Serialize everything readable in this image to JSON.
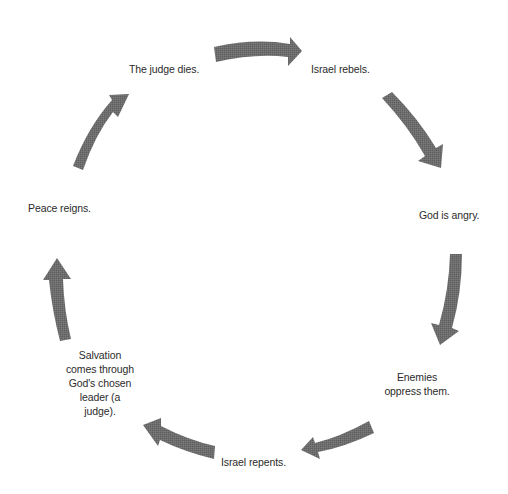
{
  "diagram": {
    "type": "cycle",
    "arrow_color": "#6b6b6b",
    "background": "#ffffff",
    "steps": [
      {
        "id": "judge-dies",
        "label": "The judge dies."
      },
      {
        "id": "israel-rebels",
        "label": "Israel rebels."
      },
      {
        "id": "god-angry",
        "label": "God is angry."
      },
      {
        "id": "enemies-oppress",
        "label_lines": [
          "Enemies",
          "oppress them."
        ]
      },
      {
        "id": "israel-repents",
        "label": "Israel repents."
      },
      {
        "id": "salvation",
        "label_lines": [
          "Salvation",
          "comes through",
          "God's chosen",
          "leader (a",
          "judge)."
        ]
      },
      {
        "id": "peace-reigns",
        "label": "Peace reigns."
      }
    ],
    "arrows": [
      {
        "from": "judge-dies",
        "to": "israel-rebels"
      },
      {
        "from": "israel-rebels",
        "to": "god-angry"
      },
      {
        "from": "god-angry",
        "to": "enemies-oppress"
      },
      {
        "from": "enemies-oppress",
        "to": "israel-repents"
      },
      {
        "from": "israel-repents",
        "to": "salvation"
      },
      {
        "from": "salvation",
        "to": "peace-reigns"
      },
      {
        "from": "peace-reigns",
        "to": "judge-dies"
      }
    ]
  }
}
